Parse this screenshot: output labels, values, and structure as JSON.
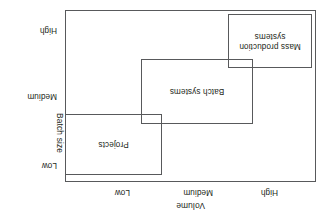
{
  "diagram": {
    "orientation": "rotated-180",
    "line_color": "#58595b",
    "text_color": "#231f20",
    "background": "#ffffff",
    "x_axis": {
      "title": "Volume",
      "ticks": [
        "High",
        "Medium",
        "Low"
      ]
    },
    "y_axis": {
      "title": "Batch size",
      "ticks": [
        "Low",
        "Medium",
        "High"
      ]
    },
    "regions": [
      {
        "id": "projects",
        "label": "Projects"
      },
      {
        "id": "batch",
        "label": "Batch systems"
      },
      {
        "id": "mass",
        "label_line1": "Mass production",
        "label_line2": "systems"
      }
    ]
  },
  "chart_data": {
    "type": "scatter",
    "title": "",
    "xlabel": "Volume",
    "ylabel": "Batch size",
    "x_ticks": [
      "High",
      "Medium",
      "Low"
    ],
    "y_ticks": [
      "Low",
      "Medium",
      "High"
    ],
    "grid": false,
    "legend": "none",
    "annotations": [
      "Projects",
      "Batch systems",
      "Mass production systems"
    ],
    "boxes": [
      {
        "name": "Projects",
        "volume": "Low",
        "batch_size": "Low"
      },
      {
        "name": "Batch systems",
        "volume": "Medium",
        "batch_size": "Medium"
      },
      {
        "name": "Mass production systems",
        "volume": "High",
        "batch_size": "High"
      }
    ]
  }
}
